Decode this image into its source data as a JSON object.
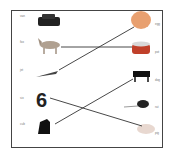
{
  "worksheet": {
    "type": "word-picture matching",
    "left": [
      {
        "word": "van",
        "picture": "car-icon"
      },
      {
        "word": "fox",
        "picture": "fox-icon"
      },
      {
        "word": "jet",
        "picture": "crocodile-icon"
      },
      {
        "word": "six",
        "picture": "six-numeral",
        "glyph": "6"
      },
      {
        "word": "cub",
        "picture": "puppy-icon"
      }
    ],
    "right": [
      {
        "word": "egg",
        "picture": "egg-icon"
      },
      {
        "word": "pot",
        "picture": "pot-icon"
      },
      {
        "word": "dog",
        "picture": "dog-icon"
      },
      {
        "word": "rat",
        "picture": "rat-icon"
      },
      {
        "word": "pig",
        "picture": "pig-icon"
      }
    ],
    "colors": {
      "line": "#333333",
      "frame": "#444444",
      "egg": "#e8a070",
      "pot": "#c0402a"
    }
  }
}
